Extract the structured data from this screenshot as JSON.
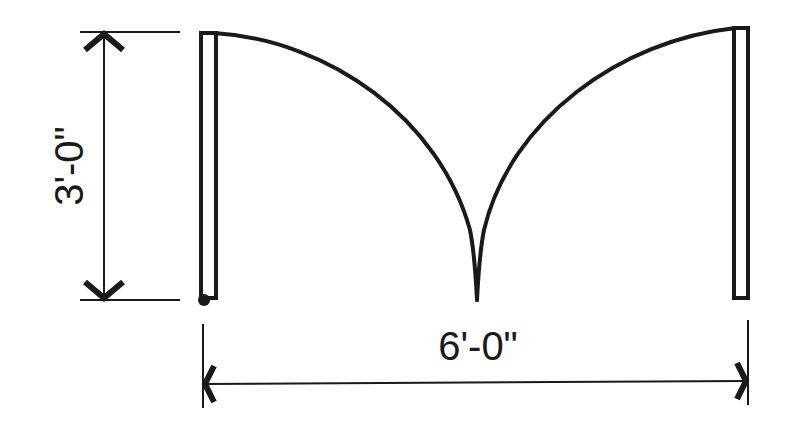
{
  "diagram": {
    "type": "floor-plan-symbol",
    "colors": {
      "ink": "#1a1a1a",
      "background": "#ffffff"
    },
    "dimensions": {
      "height_label": "3'-0\"",
      "width_label": "6'-0\""
    },
    "elements": {
      "left_door_leaf": "left door leaf (jamb)",
      "right_door_leaf": "right door leaf (jamb)",
      "left_swing_arc": "left door swing arc",
      "right_swing_arc": "right door swing arc",
      "hinge_point": "hinge pivot"
    }
  }
}
